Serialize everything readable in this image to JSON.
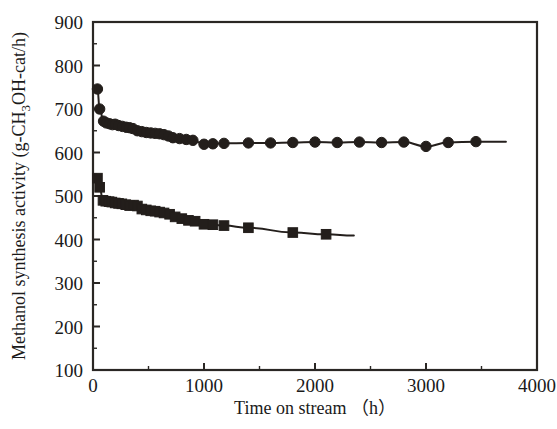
{
  "chart_data": {
    "type": "scatter",
    "title": "",
    "xlabel": "Time on stream （h）",
    "ylabel": "Methanol synthesis activity (g-CH3OH-cat/h)",
    "ylabel_parts": {
      "pre": "Methanol synthesis activity (g-CH",
      "sub": "3",
      "post": "OH-cat/h)"
    },
    "xlim": [
      0,
      4000
    ],
    "ylim": [
      100,
      900
    ],
    "xticks": [
      0,
      1000,
      2000,
      3000,
      4000
    ],
    "xtick_labels": [
      "0",
      "1000",
      "2000",
      "3000",
      "4000"
    ],
    "xticks_minor": [
      500,
      1500,
      2500,
      3500
    ],
    "yticks": [
      100,
      200,
      300,
      400,
      500,
      600,
      700,
      800,
      900
    ],
    "ytick_labels": [
      "100",
      "200",
      "300",
      "400",
      "500",
      "600",
      "700",
      "800",
      "900"
    ],
    "yticks_minor": [
      150,
      250,
      350,
      450,
      550,
      650,
      750,
      850
    ],
    "grid": false,
    "legend": "none",
    "series": [
      {
        "name": "upper-series",
        "marker": "circle",
        "color": "#231e1b",
        "x": [
          40,
          60,
          95,
          120,
          150,
          175,
          200,
          230,
          265,
          300,
          330,
          360,
          400,
          440,
          480,
          520,
          560,
          600,
          640,
          680,
          720,
          780,
          840,
          900,
          1000,
          1080,
          1180,
          1400,
          1600,
          1800,
          2000,
          2200,
          2400,
          2600,
          2800,
          3000,
          3200,
          3450
        ],
        "y": [
          746,
          700,
          672,
          668,
          666,
          664,
          665,
          662,
          660,
          658,
          657,
          655,
          650,
          648,
          646,
          645,
          644,
          643,
          641,
          638,
          634,
          632,
          630,
          628,
          619,
          620,
          621,
          622,
          622,
          623,
          624,
          623,
          624,
          623,
          624,
          614,
          623,
          625
        ],
        "line_end_x": 3720
      },
      {
        "name": "lower-series",
        "marker": "square",
        "color": "#231e1b",
        "x": [
          40,
          60,
          90,
          115,
          145,
          170,
          200,
          230,
          260,
          295,
          330,
          365,
          400,
          440,
          480,
          520,
          560,
          600,
          640,
          690,
          740,
          800,
          860,
          920,
          1000,
          1080,
          1180,
          1400,
          1800,
          2100
        ],
        "y": [
          541,
          520,
          490,
          488,
          487,
          486,
          484,
          483,
          482,
          480,
          478,
          479,
          477,
          470,
          468,
          466,
          465,
          463,
          461,
          458,
          452,
          448,
          444,
          442,
          435,
          434,
          432,
          427,
          416,
          412
        ],
        "line_end_x": 2350,
        "line_end_y": 409
      }
    ]
  }
}
